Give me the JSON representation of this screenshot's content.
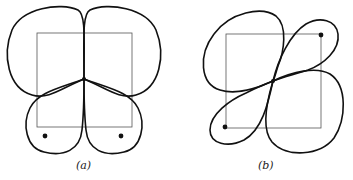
{
  "figure": {
    "panels": [
      {
        "id": "a",
        "label": "(a)",
        "description": "Four-lobed closed curve on a square with a central node; two marked points near the bottom corners"
      },
      {
        "id": "b",
        "label": "(b)",
        "description": "Four-lobed closed curve on a square with a central crossing node; two marked points at opposite corners (top-right and bottom-left)"
      }
    ],
    "colors": {
      "curve": "#111111",
      "square": "#555555",
      "background": "#ffffff"
    }
  }
}
